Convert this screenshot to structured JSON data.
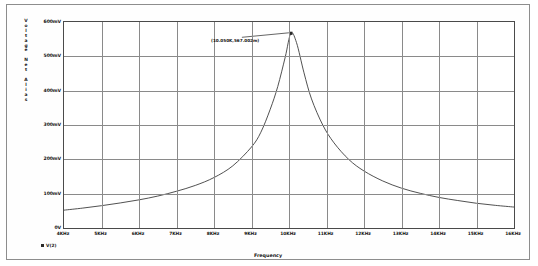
{
  "chart_data": {
    "type": "line",
    "title": "",
    "xlabel": "Frequency",
    "ylabel": "Voltage Net Alias",
    "ylabel_chars": [
      "V",
      "o",
      "l",
      "t",
      "a",
      "g",
      "e",
      "",
      "N",
      "e",
      "t",
      "",
      "A",
      "l",
      "i",
      "a",
      "s"
    ],
    "xlim": [
      4000,
      16000
    ],
    "ylim": [
      0,
      600
    ],
    "grid": true,
    "legend_position": "bottom-left",
    "xtick_labels": [
      "4KHz",
      "5KHz",
      "6KHz",
      "7KHz",
      "8KHz",
      "9KHz",
      "10KHz",
      "11KHz",
      "12KHz",
      "13KHz",
      "14KHz",
      "15KHz",
      "16KHz"
    ],
    "xtick_values": [
      4000,
      5000,
      6000,
      7000,
      8000,
      9000,
      10000,
      11000,
      12000,
      13000,
      14000,
      15000,
      16000
    ],
    "ytick_labels": [
      "600mV",
      "500mV",
      "400mV",
      "300mV",
      "200mV",
      "100mV",
      "0V"
    ],
    "ytick_values": [
      600,
      500,
      400,
      300,
      200,
      100,
      0
    ],
    "series": [
      {
        "name": "V(2)",
        "color": "#3d3d3d",
        "x": [
          4000,
          4500,
          5000,
          5500,
          6000,
          6500,
          7000,
          7500,
          8000,
          8500,
          9000,
          9250,
          9500,
          9700,
          9900,
          10050,
          10200,
          10400,
          10600,
          10900,
          11200,
          11600,
          12000,
          12500,
          13000,
          13500,
          14000,
          14500,
          15000,
          15500,
          16000
        ],
        "values": [
          52,
          58,
          65,
          73,
          82,
          93,
          107,
          124,
          147,
          181,
          236,
          279,
          346,
          412,
          498,
          567,
          540,
          452,
          376,
          300,
          248,
          199,
          166,
          137,
          116,
          101,
          89,
          80,
          72,
          66,
          61
        ]
      }
    ],
    "annotations": [
      {
        "text": "(10.050K,567.002m)",
        "x": 10050,
        "y": 567
      }
    ]
  },
  "legend": {
    "marker": "square",
    "label": "V(2)"
  }
}
